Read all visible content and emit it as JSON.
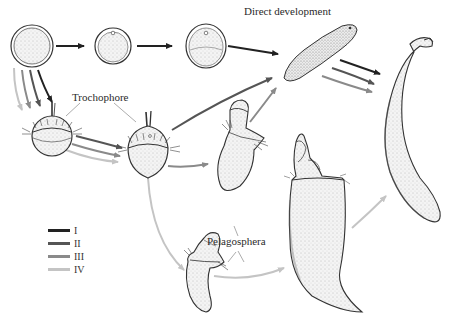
{
  "labels": {
    "direct_development": "Direct development",
    "trochophore": "Trochophore",
    "pelagosphera": "Pelagosphera"
  },
  "legend": {
    "items": [
      {
        "label": "I",
        "color": "#222222"
      },
      {
        "label": "II",
        "color": "#555555"
      },
      {
        "label": "III",
        "color": "#8a8a8a"
      },
      {
        "label": "IV",
        "color": "#c4c4c4"
      }
    ]
  },
  "pathways": {
    "I": "egg → cleavage → embryo → elongated juvenile → adult (direct development)",
    "II": "egg → trochophore → elongated juvenile → adult",
    "III": "egg → trochophore → trochophore (late) → juvenile → adult",
    "IV": "egg → trochophore → pelagosphera → pelagosphera (large) → adult"
  },
  "stages": [
    "egg",
    "early cleavage embryo",
    "late embryo",
    "vermiform juvenile",
    "adult sipunculan",
    "early trochophore",
    "late trochophore",
    "transitional larva",
    "pelagosphera larva",
    "large pelagosphera larva"
  ]
}
